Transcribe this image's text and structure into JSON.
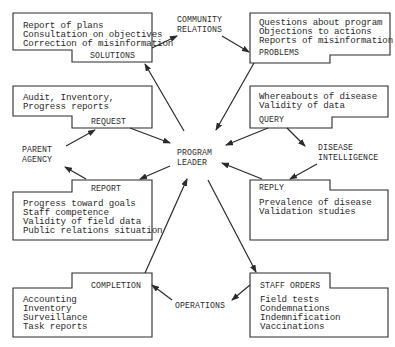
{
  "center": {
    "line1": "PROGRAM",
    "line2": "LEADER"
  },
  "nodes": {
    "community": {
      "line1": "COMMUNITY",
      "line2": "RELATIONS"
    },
    "parent": {
      "line1": "PARENT",
      "line2": "AGENCY"
    },
    "disease": {
      "line1": "DISEASE",
      "line2": "INTELLIGENCE"
    },
    "operations": {
      "line1": "OPERATIONS"
    }
  },
  "boxes": {
    "solutions": {
      "title": "SOLUTIONS",
      "items": [
        "Report of plans",
        "Consultation on objectives",
        "Correction of misinformation"
      ]
    },
    "problems": {
      "title": "PROBLEMS",
      "items": [
        "Questions about program",
        "Objections to actions",
        "Reports of misinformation"
      ]
    },
    "request": {
      "title": "REQUEST",
      "items": [
        "Audit,  Inventory,",
        "Progress reports"
      ]
    },
    "query": {
      "title": "QUERY",
      "items": [
        "Whereabouts of disease",
        "Validity of data"
      ]
    },
    "report": {
      "title": "REPORT",
      "items": [
        "Progress toward goals",
        "Staff competence",
        "Validity of field data",
        "Public relations situation"
      ]
    },
    "reply": {
      "title": "REPLY",
      "items": [
        "Prevalence of disease",
        "Validation studies"
      ]
    },
    "completion": {
      "title": "COMPLETION",
      "items": [
        "Accounting",
        "Inventory",
        "Surveillance",
        "Task reports"
      ]
    },
    "staff_orders": {
      "title": "STAFF ORDERS",
      "items": [
        "Field tests",
        "Condemnations",
        "Indemnification",
        "Vaccinations"
      ]
    }
  },
  "colors": {
    "ink": "#2b2b2b",
    "background": "#ffffff"
  }
}
